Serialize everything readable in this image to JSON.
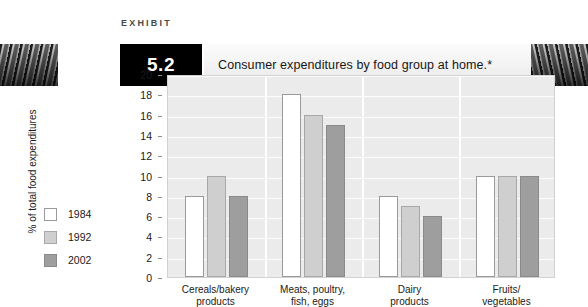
{
  "header": {
    "exhibit_label": "EXHIBIT",
    "exhibit_number": "5.2",
    "title": "Consumer expenditures by food group at home.*"
  },
  "chart_data": {
    "type": "bar",
    "title": "Consumer expenditures by food group at home.*",
    "xlabel": "",
    "ylabel": "% of total food expenditures",
    "ylim": [
      0,
      20
    ],
    "ytick_step": 2,
    "yticks": [
      "20",
      "18",
      "16",
      "14",
      "12",
      "10",
      "8",
      "6",
      "4",
      "2",
      "0"
    ],
    "grid": true,
    "legend_position": "left-outside",
    "categories": [
      "Cereals/bakery products",
      "Meats, poultry, fish, eggs",
      "Dairy products",
      "Fruits/vegetables"
    ],
    "category_lines": [
      [
        "Cereals/bakery",
        "products"
      ],
      [
        "Meats, poultry,",
        "fish, eggs"
      ],
      [
        "Dairy",
        "products"
      ],
      [
        "Fruits/",
        "vegetables"
      ]
    ],
    "series": [
      {
        "name": "1984",
        "color": "#ffffff",
        "values": [
          8,
          18,
          8,
          10
        ]
      },
      {
        "name": "1992",
        "color": "#cfcfcf",
        "values": [
          10,
          16,
          7,
          10
        ]
      },
      {
        "name": "2002",
        "color": "#9e9e9e",
        "values": [
          8,
          15,
          6,
          10
        ]
      }
    ]
  },
  "legend": {
    "items": [
      {
        "label": "1984"
      },
      {
        "label": "1992"
      },
      {
        "label": "2002"
      }
    ]
  }
}
